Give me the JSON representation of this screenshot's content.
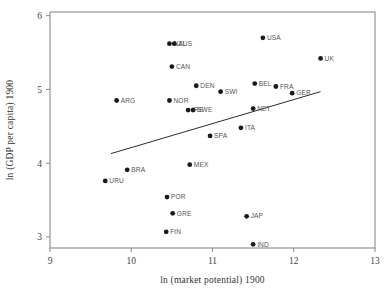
{
  "chart_data": {
    "type": "scatter",
    "title": "",
    "xlabel": "ln (market potential) 1900",
    "ylabel": "ln (GDP per capita) 1900",
    "xlim": [
      9,
      13
    ],
    "ylim": [
      2.85,
      6.05
    ],
    "xticks": [
      "9",
      "10",
      "11",
      "12",
      "13"
    ],
    "xtick_values": [
      9,
      10,
      11,
      12,
      13
    ],
    "yticks": [
      "3",
      "4",
      "5",
      "6"
    ],
    "ytick_values": [
      3,
      4,
      5,
      6
    ],
    "grid": false,
    "legend": "none",
    "points": [
      {
        "label": "NZL",
        "x": 10.47,
        "y": 5.62,
        "label_dx": 4,
        "label_dy": 2.2
      },
      {
        "label": "AUS",
        "x": 10.53,
        "y": 5.62,
        "label_dx": 4,
        "label_dy": 2.2
      },
      {
        "label": "USA",
        "x": 11.62,
        "y": 5.7,
        "label_dx": 4,
        "label_dy": 2.2
      },
      {
        "label": "UK",
        "x": 12.33,
        "y": 5.42,
        "label_dx": 4,
        "label_dy": 2.2
      },
      {
        "label": "CAN",
        "x": 10.5,
        "y": 5.31,
        "label_dx": 4,
        "label_dy": 2.2
      },
      {
        "label": "DEN",
        "x": 10.8,
        "y": 5.05,
        "label_dx": 4,
        "label_dy": 2.2
      },
      {
        "label": "BEL",
        "x": 11.52,
        "y": 5.08,
        "label_dx": 4,
        "label_dy": 2.2
      },
      {
        "label": "FRA",
        "x": 11.78,
        "y": 5.04,
        "label_dx": 4,
        "label_dy": 2.2
      },
      {
        "label": "SWI",
        "x": 11.1,
        "y": 4.97,
        "label_dx": 4,
        "label_dy": 2.2
      },
      {
        "label": "GER",
        "x": 11.98,
        "y": 4.95,
        "label_dx": 4,
        "label_dy": 2.2
      },
      {
        "label": "ARG",
        "x": 9.82,
        "y": 4.85,
        "label_dx": 4,
        "label_dy": 2.2
      },
      {
        "label": "NOR",
        "x": 10.47,
        "y": 4.85,
        "label_dx": 4,
        "label_dy": 2.2
      },
      {
        "label": "IRE",
        "x": 10.7,
        "y": 4.72,
        "label_dx": 4,
        "label_dy": 2.2
      },
      {
        "label": "SWE",
        "x": 10.76,
        "y": 4.72,
        "label_dx": 4,
        "label_dy": 2.2
      },
      {
        "label": "NET",
        "x": 11.5,
        "y": 4.74,
        "label_dx": 4,
        "label_dy": 2.2
      },
      {
        "label": "ITA",
        "x": 11.35,
        "y": 4.48,
        "label_dx": 4,
        "label_dy": 2.2
      },
      {
        "label": "SPA",
        "x": 10.97,
        "y": 4.37,
        "label_dx": 4,
        "label_dy": 2.2
      },
      {
        "label": "MEX",
        "x": 10.72,
        "y": 3.98,
        "label_dx": 4,
        "label_dy": 2.2
      },
      {
        "label": "BRA",
        "x": 9.95,
        "y": 3.91,
        "label_dx": 4,
        "label_dy": 2.2
      },
      {
        "label": "URU",
        "x": 9.68,
        "y": 3.76,
        "label_dx": 4,
        "label_dy": 2.2
      },
      {
        "label": "POR",
        "x": 10.44,
        "y": 3.54,
        "label_dx": 4,
        "label_dy": 2.2
      },
      {
        "label": "GRE",
        "x": 10.51,
        "y": 3.32,
        "label_dx": 4,
        "label_dy": 2.2
      },
      {
        "label": "JAP",
        "x": 11.42,
        "y": 3.28,
        "label_dx": 4,
        "label_dy": 2.2
      },
      {
        "label": "FIN",
        "x": 10.43,
        "y": 3.07,
        "label_dx": 4,
        "label_dy": 2.2
      },
      {
        "label": "IND",
        "x": 11.5,
        "y": 2.9,
        "label_dx": 4,
        "label_dy": 2.2
      }
    ],
    "fit_line": {
      "name": "regression-line",
      "x0": 9.75,
      "y0": 4.13,
      "x1": 12.33,
      "y1": 4.97
    }
  }
}
